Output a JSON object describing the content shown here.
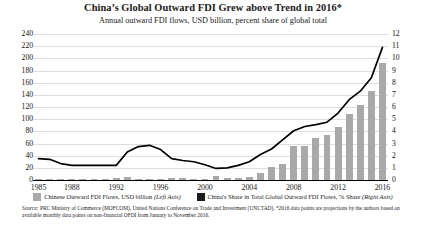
{
  "chart_data": {
    "type": "bar",
    "title": "China’s Global Outward FDI Grew above Trend in 2016*",
    "subtitle": "Annual outward FDI flows, USD billion, percent share of global total",
    "xlabel": "",
    "ylabel": "",
    "grid": true,
    "legend_position": "bottom",
    "x": [
      1985,
      1986,
      1987,
      1988,
      1989,
      1990,
      1991,
      1992,
      1993,
      1994,
      1995,
      1996,
      1997,
      1998,
      1999,
      2000,
      2001,
      2002,
      2003,
      2004,
      2005,
      2006,
      2007,
      2008,
      2009,
      2010,
      2011,
      2012,
      2013,
      2014,
      2015,
      2016
    ],
    "xtick_labels": [
      "1985",
      "1988",
      "1992",
      "1996",
      "2000",
      "2004",
      "2008",
      "2012",
      "2016"
    ],
    "xtick_values": [
      1985,
      1988,
      1992,
      1996,
      2000,
      2004,
      2008,
      2012,
      2016
    ],
    "left_axis": {
      "label": "Chinese Outward FDI Flows, USD billion",
      "ylim": [
        0,
        240
      ],
      "ticks": [
        0,
        20,
        40,
        60,
        80,
        100,
        120,
        140,
        160,
        180,
        200,
        220,
        240
      ]
    },
    "right_axis": {
      "label": "China's Share in Total Global Outward FDI Flows, % Share",
      "ylim": [
        0,
        12
      ],
      "ticks": [
        0,
        1,
        2,
        3,
        4,
        5,
        6,
        7,
        8,
        9,
        10,
        11,
        12
      ]
    },
    "series": [
      {
        "name": "Chinese Outward FDI Flows, USD billion (Left Axis)",
        "type": "bar",
        "axis": "left",
        "color": "#a9a9a9",
        "values": [
          0.6,
          0.5,
          0.6,
          0.8,
          0.8,
          0.8,
          0.9,
          4.0,
          4.4,
          2.0,
          2.0,
          2.1,
          2.6,
          2.6,
          1.8,
          0.9,
          6.9,
          2.5,
          2.9,
          5.5,
          12.3,
          21.2,
          26.5,
          55.9,
          56.5,
          68.8,
          74.7,
          87.8,
          107.8,
          123.1,
          145.7,
          192.0
        ]
      },
      {
        "name": "China's Share in Total Global Outward FDI Flows, % Share (Right Axis)",
        "type": "line",
        "axis": "right",
        "color": "#000000",
        "values": [
          1.75,
          1.7,
          1.35,
          1.2,
          1.2,
          1.2,
          1.2,
          1.2,
          2.3,
          2.75,
          2.85,
          2.5,
          1.75,
          1.6,
          1.5,
          1.25,
          0.95,
          1.0,
          1.2,
          1.5,
          2.1,
          2.55,
          3.3,
          4.05,
          4.4,
          4.55,
          4.75,
          5.5,
          6.6,
          7.3,
          8.4,
          10.9
        ]
      }
    ],
    "annotations": []
  },
  "legend": [
    {
      "swatch_color": "#a9a9a9",
      "text": "Chinese Outward FDI Flows, USD billion ",
      "axis_note": "(Left Axis)"
    },
    {
      "swatch_color": "#1a1a1a",
      "text": "China's Share in Total Global Outward FDI Flows, % Share ",
      "axis_note": "(Right Axis)"
    }
  ],
  "source": {
    "label": "Source:",
    "text": " PRC Ministry of Commerce (MOFCOM), United Nations Conference on Trade and Investment (UNCTAD), *2016 data points are projections by the authors based on available monthly data points on non-financial OFDI from January to November 2016."
  }
}
